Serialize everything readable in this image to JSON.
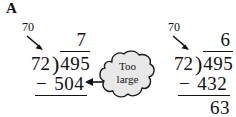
{
  "figure": {
    "panel_label": "A",
    "background_color": "#ffffff",
    "ink_color": "#111111"
  },
  "callout": {
    "shape": "cloud",
    "fill_color": "#e8e8e8",
    "stroke_color": "#1a1a1a",
    "line1": "Too",
    "line2": "large",
    "points_to": "504"
  },
  "problems": [
    {
      "id": "left-attempt",
      "hint": "70",
      "hint_target": "72",
      "divisor": "72",
      "bracket": ")",
      "dividend": "495",
      "quotient": "7",
      "minus": "−",
      "product": "504",
      "remainder": ""
    },
    {
      "id": "right-attempt",
      "hint": "70",
      "hint_target": "72",
      "divisor": "72",
      "bracket": ")",
      "dividend": "495",
      "quotient": "6",
      "minus": "−",
      "product": "432",
      "remainder": "63"
    }
  ]
}
